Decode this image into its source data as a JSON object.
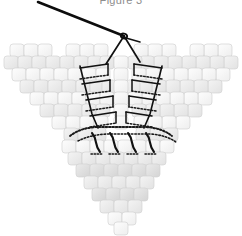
{
  "figure": {
    "caption": "Figure 3",
    "caption_color": "#8d8d8d",
    "background": "#ffffff",
    "width": 242,
    "height": 236
  },
  "palette": {
    "bead_fill_light": "#f6f6f6",
    "bead_fill_mid": "#ececec",
    "bead_fill_dark": "#dcdcdc",
    "bead_stroke": "#d2d2d2",
    "thread_solid": "#111111",
    "thread_dotted": "#1a1a1a",
    "needle": "#0d0d0d"
  },
  "elements": {
    "needle_label": "beading-needle",
    "thread_label": "working-thread",
    "left_wing_label": "left-wing-bead-panel",
    "right_wing_label": "right-wing-bead-panel",
    "body_label": "lower-body-bead-panel",
    "ladder_left_label": "left-ladder-stitch-thread",
    "ladder_right_label": "right-ladder-stitch-thread",
    "bottom_band_label": "bottom-dotted-thread-band",
    "staples_label": "bottom-vertical-thread-staples"
  },
  "geometry": {
    "needle_tip": [
      38,
      2
    ],
    "needle_eye": [
      124,
      36
    ],
    "thread_fork_left": [
      106,
      64
    ],
    "thread_fork_right": [
      140,
      62
    ],
    "bead_w": 14,
    "bead_h": 13,
    "bead_radius": 3
  },
  "bead_rows": {
    "left_wing": [
      {
        "y": 44,
        "xs": [
          10,
          24,
          38,
          66,
          80,
          94
        ],
        "shade": "light"
      },
      {
        "y": 56,
        "xs": [
          4,
          18,
          32,
          46,
          60,
          74,
          88,
          100
        ],
        "shade": "mid"
      },
      {
        "y": 68,
        "xs": [
          12,
          26,
          40,
          54,
          68,
          82,
          96
        ],
        "shade": "light"
      },
      {
        "y": 80,
        "xs": [
          20,
          34,
          48,
          62,
          76,
          90,
          102
        ],
        "shade": "mid"
      },
      {
        "y": 92,
        "xs": [
          30,
          44,
          58,
          72,
          86,
          100
        ],
        "shade": "light"
      },
      {
        "y": 104,
        "xs": [
          40,
          54,
          68,
          82,
          96
        ],
        "shade": "mid"
      },
      {
        "y": 116,
        "xs": [
          52,
          66,
          80,
          94
        ],
        "shade": "light"
      },
      {
        "y": 128,
        "xs": [
          64,
          78,
          92
        ],
        "shade": "mid"
      }
    ],
    "right_wing": [
      {
        "y": 44,
        "xs": [
          218,
          204,
          190,
          162,
          148,
          134
        ],
        "shade": "light"
      },
      {
        "y": 56,
        "xs": [
          224,
          210,
          196,
          182,
          168,
          154,
          140,
          128
        ],
        "shade": "mid"
      },
      {
        "y": 68,
        "xs": [
          216,
          202,
          188,
          174,
          160,
          146,
          132
        ],
        "shade": "light"
      },
      {
        "y": 80,
        "xs": [
          208,
          194,
          180,
          166,
          152,
          138,
          126
        ],
        "shade": "mid"
      },
      {
        "y": 92,
        "xs": [
          198,
          184,
          170,
          156,
          142,
          128
        ],
        "shade": "light"
      },
      {
        "y": 104,
        "xs": [
          188,
          174,
          160,
          146,
          132
        ],
        "shade": "mid"
      },
      {
        "y": 116,
        "xs": [
          176,
          162,
          148,
          134
        ],
        "shade": "light"
      },
      {
        "y": 128,
        "xs": [
          164,
          150,
          136
        ],
        "shade": "mid"
      }
    ],
    "center": [
      {
        "y": 56,
        "xs": [
          114
        ],
        "shade": "light"
      },
      {
        "y": 68,
        "xs": [
          114
        ],
        "shade": "light"
      },
      {
        "y": 80,
        "xs": [
          114
        ],
        "shade": "light"
      },
      {
        "y": 92,
        "xs": [
          114
        ],
        "shade": "light"
      },
      {
        "y": 104,
        "xs": [
          114
        ],
        "shade": "light"
      },
      {
        "y": 116,
        "xs": [
          114
        ],
        "shade": "light"
      }
    ],
    "body": [
      {
        "y": 140,
        "xs": [
          62,
          76,
          90,
          104,
          118,
          132,
          146,
          160
        ],
        "shade": "light"
      },
      {
        "y": 152,
        "xs": [
          68,
          82,
          96,
          110,
          124,
          138,
          152
        ],
        "shade": "mid"
      },
      {
        "y": 164,
        "xs": [
          76,
          90,
          104,
          118,
          132,
          146
        ],
        "shade": "dark"
      },
      {
        "y": 176,
        "xs": [
          84,
          98,
          112,
          126,
          140
        ],
        "shade": "mid"
      },
      {
        "y": 188,
        "xs": [
          92,
          106,
          120,
          134
        ],
        "shade": "dark"
      },
      {
        "y": 200,
        "xs": [
          100,
          114,
          128
        ],
        "shade": "mid"
      },
      {
        "y": 212,
        "xs": [
          108,
          122
        ],
        "shade": "light"
      },
      {
        "y": 222,
        "xs": [
          114
        ],
        "shade": "light"
      }
    ]
  },
  "ladder_left": {
    "rungs": [
      {
        "x1": 80,
        "y1": 68,
        "x2": 108,
        "y2": 64
      },
      {
        "x1": 82,
        "y1": 84,
        "x2": 110,
        "y2": 80
      },
      {
        "x1": 86,
        "y1": 100,
        "x2": 113,
        "y2": 96
      },
      {
        "x1": 90,
        "y1": 116,
        "x2": 116,
        "y2": 112
      }
    ],
    "spine": "M 80 66 L 84 82 L 88 98 L 92 114 L 98 128"
  },
  "ladder_right": {
    "rungs": [
      {
        "x1": 162,
        "y1": 68,
        "x2": 134,
        "y2": 64
      },
      {
        "x1": 160,
        "y1": 84,
        "x2": 132,
        "y2": 80
      },
      {
        "x1": 156,
        "y1": 100,
        "x2": 129,
        "y2": 96
      },
      {
        "x1": 152,
        "y1": 116,
        "x2": 126,
        "y2": 112
      }
    ],
    "spine": "M 162 66 L 158 82 L 154 98 L 150 114 L 144 128"
  },
  "bottom_band": {
    "path": "M 70 136 Q 80 128 96 127 L 146 127 Q 162 128 172 136",
    "staples": [
      {
        "x": 96,
        "y1": 133,
        "y2": 152
      },
      {
        "x": 114,
        "y1": 133,
        "y2": 152
      },
      {
        "x": 132,
        "y1": 133,
        "y2": 152
      },
      {
        "x": 150,
        "y1": 133,
        "y2": 152
      }
    ]
  }
}
